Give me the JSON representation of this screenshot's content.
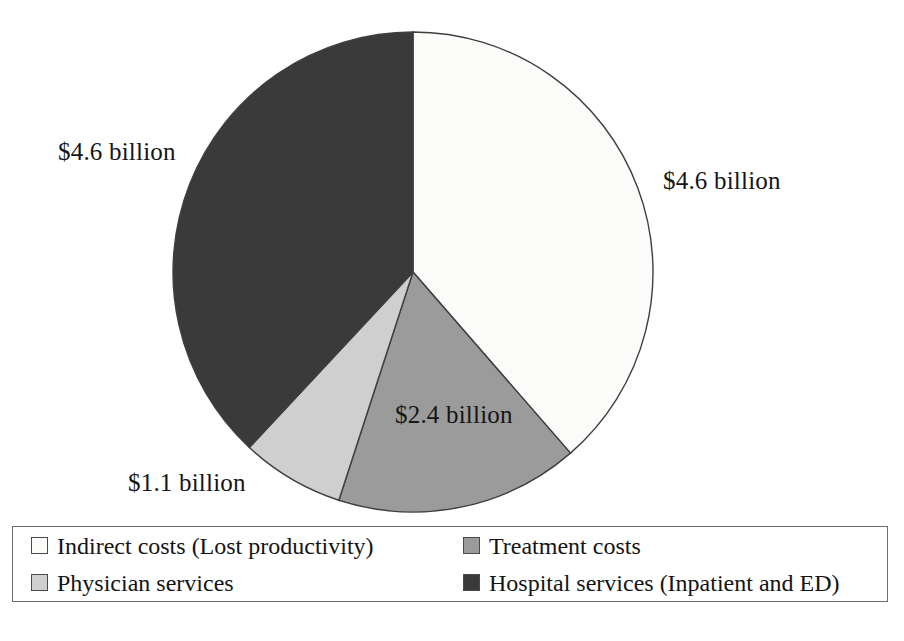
{
  "chart_data": {
    "type": "pie",
    "title": "",
    "subtitle": "",
    "xlabel": "",
    "ylabel": "",
    "grid": false,
    "legend_position": "bottom",
    "units": "billions of US dollars",
    "total_label": "",
    "categories": [
      "Indirect costs (Lost productivity)",
      "Treatment costs",
      "Physician services",
      "Hospital services (Inpatient and ED)"
    ],
    "values": [
      4.6,
      2.4,
      1.1,
      4.6
    ],
    "data_labels": [
      "$4.6 billion",
      "$2.4 billion",
      "$1.1 billion",
      "$4.6 billion"
    ],
    "colors": [
      "#fbfbfa",
      "#9b9b9b",
      "#cfcfcf",
      "#3a3a3a"
    ],
    "slice_border_color": "#3f3f3f",
    "start_angle_deg": 0,
    "direction": "clockwise",
    "slices": [
      {
        "name": "Indirect costs (Lost productivity)",
        "value": 4.6,
        "label": "$4.6 billion",
        "color": "#fbfbfa",
        "start_deg": 0,
        "sweep_deg": 139,
        "label_position": "right-outside"
      },
      {
        "name": "Treatment costs",
        "value": 2.4,
        "label": "$2.4 billion",
        "color": "#9b9b9b",
        "start_deg": 139,
        "sweep_deg": 59,
        "label_position": "inside"
      },
      {
        "name": "Physician services",
        "value": 1.1,
        "label": "$1.1 billion",
        "color": "#cfcfcf",
        "start_deg": 198,
        "sweep_deg": 25,
        "label_position": "bottom-left-outside"
      },
      {
        "name": "Hospital services (Inpatient and ED)",
        "value": 4.6,
        "label": "$4.6 billion",
        "color": "#3a3a3a",
        "start_deg": 223,
        "sweep_deg": 137,
        "label_position": "left-outside"
      }
    ]
  },
  "labels": {
    "indirect_costs": "$4.6 billion",
    "treatment_costs": "$2.4 billion",
    "physician_services": "$1.1 billion",
    "hospital_services": "$4.6 billion"
  },
  "legend": {
    "items": [
      {
        "label": "Indirect costs (Lost productivity)",
        "swatch": "#fbfbfa"
      },
      {
        "label": "Treatment costs",
        "swatch": "#9b9b9b"
      },
      {
        "label": "Physician services",
        "swatch": "#cfcfcf"
      },
      {
        "label": "Hospital services (Inpatient and ED)",
        "swatch": "#3a3a3a"
      }
    ]
  }
}
